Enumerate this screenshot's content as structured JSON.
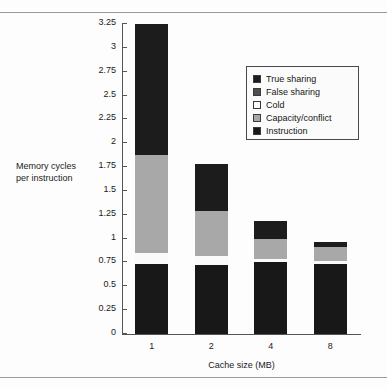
{
  "chart_data": {
    "type": "bar",
    "subtype": "stacked-vertical",
    "title": "",
    "xlabel": "Cache size (MB)",
    "ylabel": "Memory cycles per instruction",
    "categories": [
      "1",
      "2",
      "4",
      "8"
    ],
    "ylim": [
      0,
      3.25
    ],
    "yticks": [
      "0",
      "0.25",
      "0.5",
      "0.75",
      "1",
      "1.25",
      "1.5",
      "1.75",
      "2",
      "2.25",
      "2.5",
      "2.75",
      "3",
      "3.25"
    ],
    "ytick_values": [
      0,
      0.25,
      0.5,
      0.75,
      1,
      1.25,
      1.5,
      1.75,
      2,
      2.25,
      2.5,
      2.75,
      3,
      3.25
    ],
    "grid": false,
    "legend_position": "upper-right",
    "series": [
      {
        "name": "True sharing",
        "color": "#1c1c1c",
        "values": [
          1.37,
          0.49,
          0.18,
          0.05
        ]
      },
      {
        "name": "False sharing",
        "color": "#4f4f4f",
        "values": [
          0.0,
          0.0,
          0.0,
          0.0
        ]
      },
      {
        "name": "Cold",
        "color": "#fafafa",
        "values": [
          0.12,
          0.1,
          0.04,
          0.04
        ]
      },
      {
        "name": "Capacity/conflict",
        "color": "#a8a8a8",
        "values": [
          1.03,
          0.47,
          0.21,
          0.14
        ]
      },
      {
        "name": "Instruction",
        "color": "#181818",
        "values": [
          0.73,
          0.72,
          0.75,
          0.73
        ]
      }
    ],
    "totals": [
      3.25,
      1.78,
      1.18,
      0.96
    ],
    "stack_order_bottom_to_top": [
      "Instruction",
      "Cold",
      "Capacity/conflict",
      "True sharing"
    ]
  },
  "legend": {
    "items": [
      {
        "label": "True sharing",
        "swatch": "swatch-true-sharing"
      },
      {
        "label": "False sharing",
        "swatch": "swatch-false-sharing"
      },
      {
        "label": "Cold",
        "swatch": "swatch-cold"
      },
      {
        "label": "Capacity/conflict",
        "swatch": "swatch-capacity-conflict"
      },
      {
        "label": "Instruction",
        "swatch": "swatch-instruction"
      }
    ]
  },
  "axes": {
    "y_label_line1": "Memory cycles",
    "y_label_line2": "per instruction",
    "x_label": "Cache size (MB)"
  }
}
